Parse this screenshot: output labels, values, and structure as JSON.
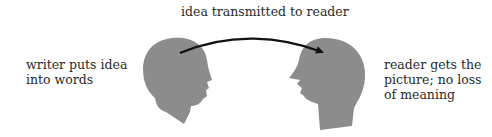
{
  "diagram": {
    "top_label": "idea transmitted to reader",
    "left_label": [
      "writer puts idea",
      "into words"
    ],
    "right_label": [
      "reader gets the",
      "picture; no loss",
      "of meaning"
    ],
    "colors": {
      "head": "#8c8c8c",
      "arrow": "#111111",
      "text": "#2a2a2a"
    }
  }
}
